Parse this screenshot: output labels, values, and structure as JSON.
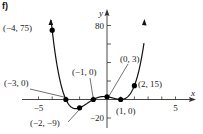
{
  "part_label": "f)",
  "chart_data": {
    "type": "line",
    "title": "",
    "function": "f(x) = (x+3)(x+1)(x-1)^2",
    "xlabel": "x",
    "ylabel": "y",
    "xlim": [
      -6.5,
      6.5
    ],
    "ylim": [
      -30,
      90
    ],
    "x_ticks": [
      -5,
      -4,
      -3,
      -2,
      -1,
      1,
      2,
      3,
      4,
      5
    ],
    "x_tick_labels": [
      {
        "value": -5,
        "label": "−5"
      },
      {
        "value": 5,
        "label": "5"
      }
    ],
    "y_ticks": [
      -20,
      20,
      40,
      60,
      80
    ],
    "y_tick_labels": [
      {
        "value": 80,
        "label": "80"
      },
      {
        "value": -20,
        "label": "−20"
      }
    ],
    "grid": false,
    "legend": null,
    "points": [
      {
        "x": -4,
        "y": 75,
        "label": "(−4, 75)"
      },
      {
        "x": -3,
        "y": 0,
        "label": "(−3, 0)"
      },
      {
        "x": -2,
        "y": -9,
        "label": "(−2, −9)"
      },
      {
        "x": -1,
        "y": 0,
        "label": "(−1, 0)"
      },
      {
        "x": 0,
        "y": 3,
        "label": "(0, 3)"
      },
      {
        "x": 1,
        "y": 0,
        "label": "(1, 0)"
      },
      {
        "x": 2,
        "y": 15,
        "label": "(2, 15)"
      }
    ],
    "curve_range": [
      -4.1,
      2.7
    ]
  }
}
